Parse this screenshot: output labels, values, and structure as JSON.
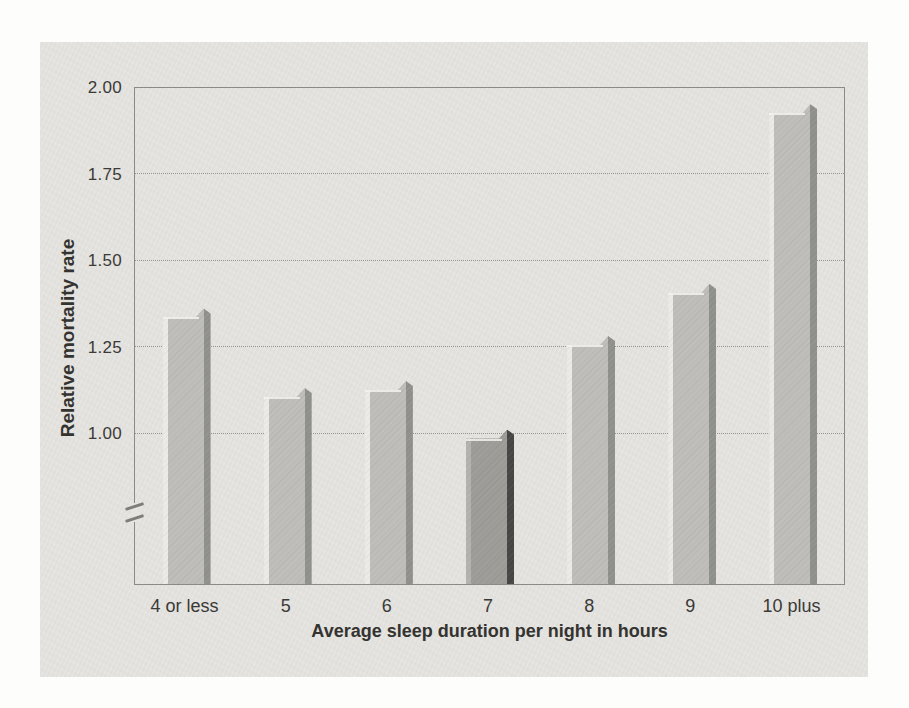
{
  "figure": {
    "page_background": "#fdfdfc",
    "panel_color": "#e5e4e0"
  },
  "chart_data": {
    "type": "bar",
    "title": "",
    "categories": [
      "4 or less",
      "5",
      "6",
      "7",
      "8",
      "9",
      "10 plus"
    ],
    "values": [
      1.34,
      1.11,
      1.13,
      0.99,
      1.26,
      1.41,
      1.93
    ],
    "highlight_index": 3,
    "xlabel": "Average sleep duration per night in hours",
    "ylabel": "Relative mortality rate",
    "y_ticks": [
      {
        "label": "2.00",
        "value": 2.0
      },
      {
        "label": "1.75",
        "value": 1.75
      },
      {
        "label": "1.50",
        "value": 1.5
      },
      {
        "label": "1.25",
        "value": 1.25
      },
      {
        "label": "1.00",
        "value": 1.0
      }
    ],
    "ylim": [
      1.0,
      2.0
    ],
    "axis_break": true,
    "grid": "horizontal-dotted",
    "legend": "none",
    "colors": {
      "bar_highlight_stripe": "#eceae6",
      "bar_face": "#bebdb9",
      "bar_edge_dark": "#90908d",
      "bar7_highlight_stripe": "#b3b2af",
      "bar7_face": "#9d9c99",
      "bar7_edge_dark": "#474645",
      "bar_gloss": "#f3f2ee",
      "axis_line": "#8a8a87",
      "gridline": "#96958f",
      "text": "#3a3936"
    }
  }
}
